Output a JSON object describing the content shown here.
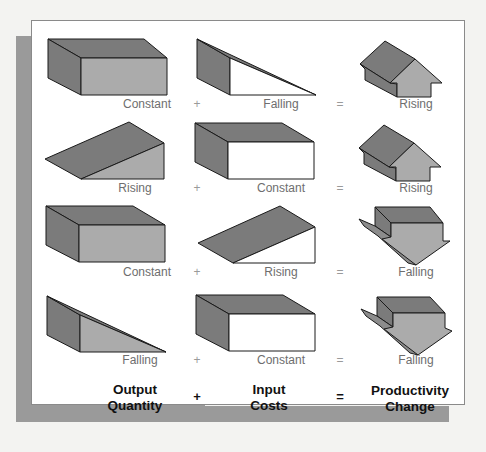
{
  "colors": {
    "dark_face": "#7b7b7b",
    "mid_face": "#ababab",
    "light_face": "#ffffff",
    "outline": "#1a1a1a",
    "panel_shadow": "#9a9a9a",
    "background": "#f3f3f1"
  },
  "rows": [
    {
      "output": "Constant",
      "op1": "+",
      "input": "Falling",
      "op2": "=",
      "productivity": "Rising"
    },
    {
      "output": "Rising",
      "op1": "+",
      "input": "Constant",
      "op2": "=",
      "productivity": "Rising"
    },
    {
      "output": "Constant",
      "op1": "+",
      "input": "Rising",
      "op2": "=",
      "productivity": "Falling"
    },
    {
      "output": "Falling",
      "op1": "+",
      "input": "Constant",
      "op2": "=",
      "productivity": "Falling"
    }
  ],
  "headers": {
    "output_line1": "Output",
    "output_line2": "Quantity",
    "plus": "+",
    "input_line1": "Input",
    "input_line2": "Costs",
    "equals": "=",
    "productivity_line1": "Productivity",
    "productivity_line2": "Change"
  },
  "shape_icons": {
    "output": [
      "constant-box-icon",
      "rising-wedge-icon",
      "constant-box-icon",
      "falling-wedge-icon"
    ],
    "input": [
      "falling-wedge-icon",
      "constant-box-icon",
      "rising-wedge-icon",
      "constant-box-icon"
    ],
    "productivity": [
      "up-arrow-icon",
      "up-arrow-icon",
      "down-arrow-icon",
      "down-arrow-icon"
    ]
  }
}
